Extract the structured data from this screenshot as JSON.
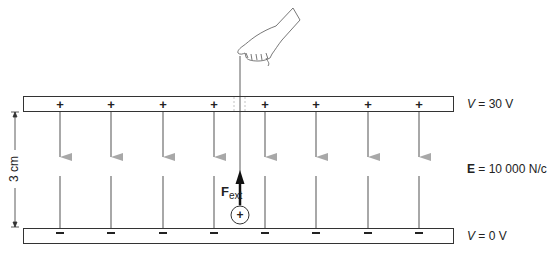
{
  "figure": {
    "top_plate": {
      "potential_label": "V = 30 V",
      "var": "V",
      "rest": " = 30 V",
      "sign": "+"
    },
    "bottom_plate": {
      "potential_label": "V = 0 V",
      "var": "V",
      "rest": " = 0 V",
      "sign": "−"
    },
    "separation_label": "3 cm",
    "field_label": {
      "symbol": "E",
      "rest": " = 10 000 N/c"
    },
    "force_label": {
      "symbol": "F",
      "subscript": "ext"
    },
    "charge_symbol": "+",
    "field_line_count": 8,
    "colors": {
      "plate_stroke": "#333333",
      "field_line": "#a8a8a8",
      "force_arrow": "#111111",
      "text": "#222222"
    }
  }
}
